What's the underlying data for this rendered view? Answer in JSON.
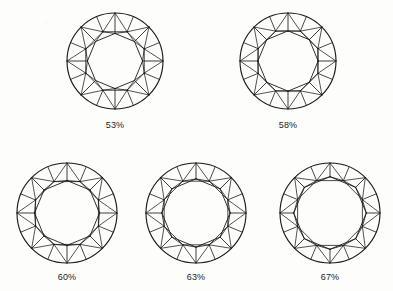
{
  "figure": {
    "background_color": "#fdfdfc",
    "line_color": "#1a1a1a",
    "caption_color": "#1c1c1c",
    "rows": 2,
    "diamonds": [
      {
        "id": "diamond-53",
        "label": "53%",
        "table_percent": 53,
        "center_x": 115,
        "center_y": 61,
        "radius": 48,
        "caption_x": 115,
        "caption_y": 120
      },
      {
        "id": "diamond-58",
        "label": "58%",
        "table_percent": 58,
        "center_x": 288,
        "center_y": 61,
        "radius": 48,
        "caption_x": 288,
        "caption_y": 120
      },
      {
        "id": "diamond-60",
        "label": "60%",
        "table_percent": 60,
        "center_x": 67,
        "center_y": 213,
        "radius": 50,
        "caption_x": 67,
        "caption_y": 272
      },
      {
        "id": "diamond-63",
        "label": "63%",
        "table_percent": 63,
        "center_x": 196,
        "center_y": 213,
        "radius": 50,
        "caption_x": 196,
        "caption_y": 272
      },
      {
        "id": "diamond-67",
        "label": "67%",
        "table_percent": 67,
        "center_x": 330,
        "center_y": 213,
        "radius": 50,
        "caption_x": 330,
        "caption_y": 272
      }
    ]
  }
}
